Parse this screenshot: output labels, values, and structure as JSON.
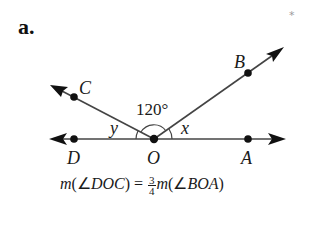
{
  "problem": {
    "label": "a.",
    "star": "*"
  },
  "diagram": {
    "points": {
      "C": "C",
      "B": "B",
      "D": "D",
      "O": "O",
      "A": "A"
    },
    "angles": {
      "COB": "120°",
      "x": "x",
      "y": "y"
    },
    "colors": {
      "stroke": "#444444",
      "ink": "#111111"
    }
  },
  "formula": {
    "lhs_m": "m",
    "lhs_open": "(∠",
    "lhs_angle": "DOC",
    "lhs_close": ")",
    "equals": " = ",
    "frac_num": "3",
    "frac_den": "4",
    "rhs_m": "m",
    "rhs_open": "(∠",
    "rhs_angle": "BOA",
    "rhs_close": ")"
  }
}
